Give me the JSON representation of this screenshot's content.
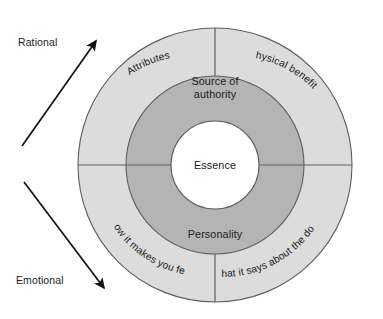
{
  "diagram": {
    "type": "concentric-ring-wheel",
    "title": "",
    "center": {
      "label": "Essence",
      "fill": "#ffffff"
    },
    "inner_ring": {
      "fill": "#b4b4b4",
      "segments": [
        {
          "id": "source-of-authority",
          "label": "Source of authority",
          "label_line1": "Source of",
          "label_line2": "authority",
          "position": "top"
        },
        {
          "id": "personality",
          "label": "Personality",
          "label_line1": "Personality",
          "label_line2": "",
          "position": "bottom"
        }
      ]
    },
    "outer_ring": {
      "fill": "#dcdcdc",
      "segments": [
        {
          "id": "attributes",
          "label": "Attributes",
          "position": "top-left",
          "side": "rational"
        },
        {
          "id": "physical-benefits",
          "label": "Physical benefits",
          "position": "top-right",
          "side": "rational"
        },
        {
          "id": "how-it-makes-you-feel",
          "label": "How it makes you feel",
          "position": "bottom-left",
          "side": "emotional"
        },
        {
          "id": "what-it-says-about-the-donor",
          "label": "What it says about the donor",
          "position": "bottom-right",
          "side": "emotional"
        }
      ]
    },
    "axes": [
      {
        "id": "rational",
        "label": "Rational",
        "direction": "up-right"
      },
      {
        "id": "emotional",
        "label": "Emotional",
        "direction": "down-right"
      }
    ],
    "colors": {
      "outer_ring": "#dcdcdc",
      "inner_ring": "#b4b4b4",
      "center": "#ffffff",
      "stroke": "#5e5e5e",
      "text": "#1b1b1b",
      "arrow": "#111111",
      "background": "#ffffff"
    }
  }
}
